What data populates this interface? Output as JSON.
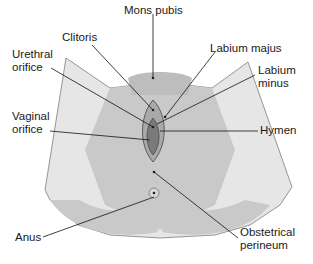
{
  "diagram": {
    "type": "anatomical-labeled-illustration",
    "colors": {
      "outer_region": "#c9c9c9",
      "inner_region": "#e4e4e4",
      "center_dark": "#7a7a7a",
      "outline": "#333333",
      "leader_line": "#111111",
      "label_text": "#1a1a1a"
    },
    "labels": {
      "mons_pubis": "Mons pubis",
      "clitoris": "Clitoris",
      "labium_majus": "Labium majus",
      "urethral_orifice_line1": "Urethral",
      "urethral_orifice_line2": "orifice",
      "labium_minus_line1": "Labium",
      "labium_minus_line2": "minus",
      "vaginal_orifice_line1": "Vaginal",
      "vaginal_orifice_line2": "orifice",
      "hymen": "Hymen",
      "anus": "Anus",
      "obstetrical_perineum_line1": "Obstetrical",
      "obstetrical_perineum_line2": "perineum"
    }
  }
}
